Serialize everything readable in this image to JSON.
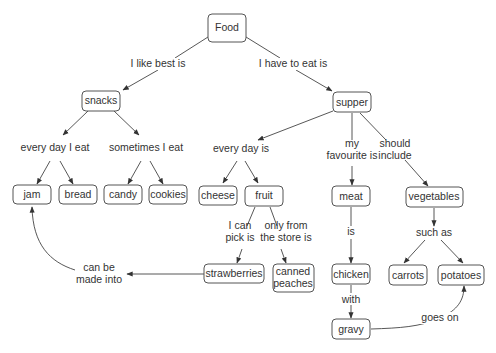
{
  "diagram": {
    "type": "concept-map",
    "nodes": {
      "food": "Food",
      "snacks": "snacks",
      "supper": "supper",
      "jam": "jam",
      "bread": "bread",
      "candy": "candy",
      "cookies": "cookies",
      "cheese": "cheese",
      "fruit": "fruit",
      "meat": "meat",
      "vegetables": "vegetables",
      "strawberries": "strawberries",
      "canned_peaches_1": "canned",
      "canned_peaches_2": "peaches",
      "chicken": "chicken",
      "carrots": "carrots",
      "potatoes": "potatoes",
      "gravy": "gravy"
    },
    "links": {
      "i_like_best_is": "I like best is",
      "i_have_to_eat_is": "I have to eat is",
      "every_day_i_eat": "every day I eat",
      "sometimes_i_eat": "sometimes I eat",
      "every_day_is": "every day is",
      "my_favourite_is_1": "my",
      "my_favourite_is_2": "favourite is",
      "should_include_1": "should",
      "should_include_2": "include",
      "i_can_pick_is_1": "I can",
      "i_can_pick_is_2": "pick is",
      "only_from_store_1": "only from",
      "only_from_store_2": "the store is",
      "is": "is",
      "such_as": "such as",
      "with": "with",
      "can_be_made_into_1": "can be",
      "can_be_made_into_2": "made into",
      "goes_on": "goes on"
    }
  }
}
